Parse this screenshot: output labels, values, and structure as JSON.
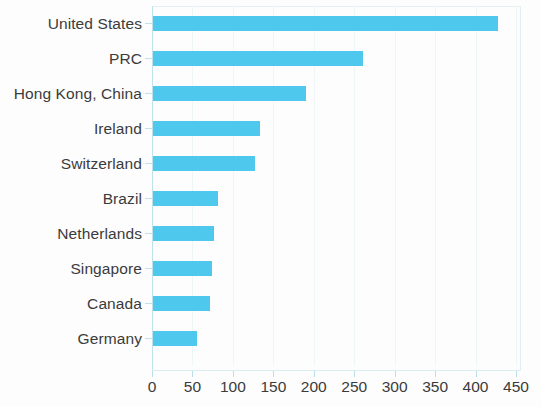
{
  "chart_data": {
    "type": "bar",
    "orientation": "horizontal",
    "title": "",
    "subtitle": "",
    "xlabel": "",
    "ylabel": "",
    "categories": [
      "United States",
      "PRC",
      "Hong Kong, China",
      "Ireland",
      "Switzerland",
      "Brazil",
      "Netherlands",
      "Singapore",
      "Canada",
      "Germany"
    ],
    "values": [
      427,
      260,
      189,
      132,
      126,
      80,
      75,
      73,
      70,
      54
    ],
    "series": [
      {
        "name": "",
        "values": [
          427,
          260,
          189,
          132,
          126,
          80,
          75,
          73,
          70,
          54
        ]
      }
    ],
    "xlim": [
      0,
      450
    ],
    "xticks": [
      0,
      50,
      100,
      150,
      200,
      250,
      300,
      350,
      400,
      450
    ],
    "xtick_labels": [
      "0",
      "50",
      "100",
      "150",
      "200",
      "250",
      "300",
      "350",
      "400",
      "450"
    ],
    "grid": true,
    "grid_axis": "x",
    "legend": false,
    "legend_position": "none",
    "bar_color": "#4ec8ec",
    "grid_color": "#eef6f8",
    "axis_color": "#bfe2ea",
    "text_color": "#3b3b3b",
    "background": "#fdfdfd",
    "annotations": []
  }
}
